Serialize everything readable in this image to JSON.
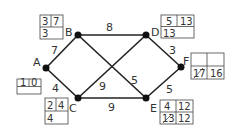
{
  "nodes": {
    "A": {
      "label": "A",
      "x": 46,
      "y": 68
    },
    "B": {
      "label": "B",
      "x": 78,
      "y": 35
    },
    "C": {
      "label": "C",
      "x": 78,
      "y": 98
    },
    "D": {
      "label": "D",
      "x": 146,
      "y": 35
    },
    "E": {
      "label": "E",
      "x": 146,
      "y": 98
    },
    "F": {
      "label": "F",
      "x": 181,
      "y": 67
    }
  },
  "edges": [
    {
      "from": "A",
      "to": "B",
      "weight": "7"
    },
    {
      "from": "A",
      "to": "C",
      "weight": "4"
    },
    {
      "from": "B",
      "to": "D",
      "weight": "8"
    },
    {
      "from": "C",
      "to": "E",
      "weight": "9"
    },
    {
      "from": "B",
      "to": "E",
      "weight": "5"
    },
    {
      "from": "C",
      "to": "D",
      "weight": "9"
    },
    {
      "from": "D",
      "to": "F",
      "weight": "3"
    },
    {
      "from": "E",
      "to": "F",
      "weight": "5"
    }
  ],
  "boxes": {
    "A": {
      "order": "1",
      "value": "0",
      "bottom": "",
      "bottom_struck": ""
    },
    "B": {
      "order": "3",
      "value": "7",
      "bottom": "3",
      "bottom_struck": ""
    },
    "C": {
      "order": "2",
      "value": "4",
      "bottom": "4",
      "bottom_struck": ""
    },
    "D": {
      "order": "5",
      "value": "13",
      "bottom": "13",
      "bottom_struck": ""
    },
    "E": {
      "order": "4",
      "value": "12",
      "bottom": "12",
      "bottom_struck": "13"
    },
    "F": {
      "order": "",
      "value": "",
      "bottom": "16",
      "bottom_struck": "17"
    }
  }
}
